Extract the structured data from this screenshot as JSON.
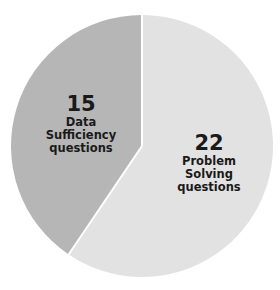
{
  "chart_data": {
    "type": "pie",
    "title": "",
    "categories": [
      "Data Sufficiency questions",
      "Problem Solving questions"
    ],
    "values": [
      15,
      22
    ],
    "colors": [
      "#b6b6b6",
      "#e2e2e2"
    ],
    "start_angle_deg": 0,
    "direction": "counterclockwise-first-slice",
    "legend": "none (inline labels)",
    "labels": [
      {
        "value": "15",
        "lines": [
          "Data",
          "Sufficiency",
          "questions"
        ]
      },
      {
        "value": "22",
        "lines": [
          "Problem",
          "Solving",
          "questions"
        ]
      }
    ]
  },
  "layout": {
    "cx": 142,
    "cy": 146,
    "r": 131,
    "divider_color": "#ffffff"
  }
}
